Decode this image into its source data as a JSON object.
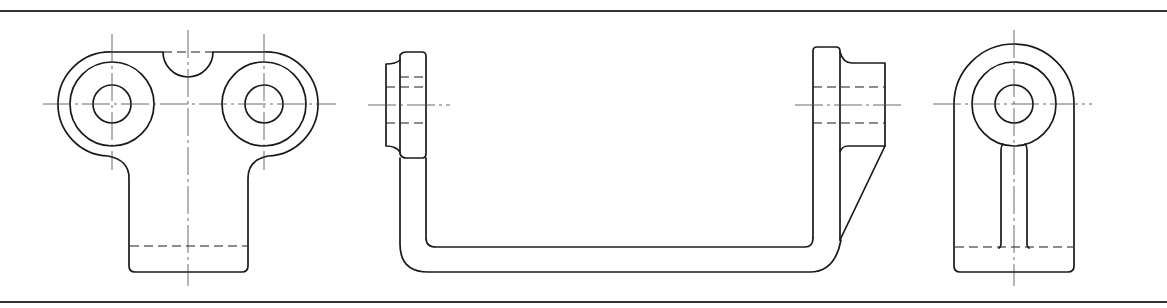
{
  "drawing": {
    "type": "orthographic-projection",
    "description": "Three-view technical drawing of a bracket with two bosses",
    "views": [
      {
        "id": "front",
        "label": "Front view"
      },
      {
        "id": "top",
        "label": "Side/top view (U-shaped bracket)"
      },
      {
        "id": "side",
        "label": "Right side view"
      }
    ],
    "line_types": [
      "object lines",
      "hidden (dashed) lines",
      "center lines"
    ],
    "colors": {
      "line": "#1a1a1a",
      "background": "#ffffff",
      "frame": "#333333"
    }
  }
}
